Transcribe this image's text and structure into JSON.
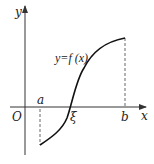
{
  "diagram": {
    "axes": {
      "x_label": "x",
      "y_label": "y",
      "origin_label": "O"
    },
    "points": {
      "a": "a",
      "b": "b",
      "xi": "ξ"
    },
    "curve_label": "y=f (x)",
    "colors": {
      "curve": "#111111",
      "axis": "#333333",
      "dashed": "#555555",
      "background": "#ffffff"
    }
  }
}
